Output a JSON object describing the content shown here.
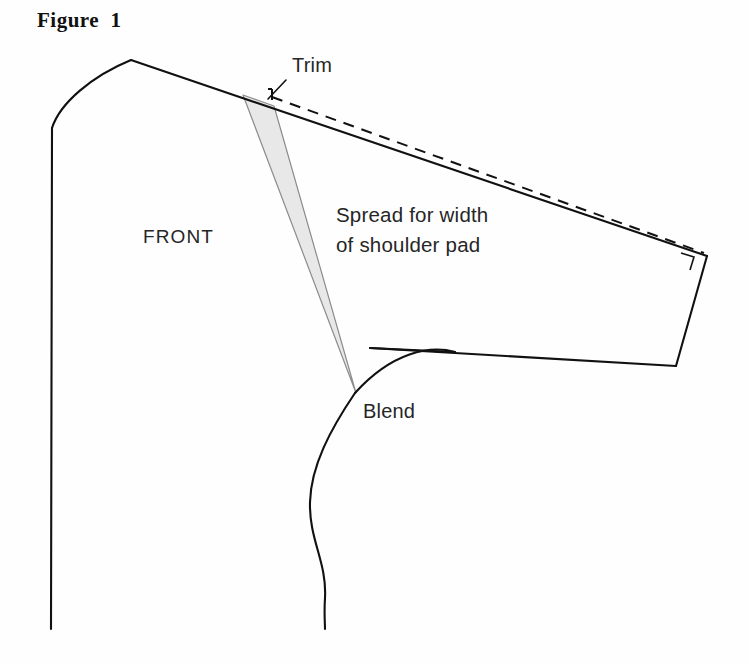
{
  "figure": {
    "title": "Figure  1",
    "background_color": "#fefefe",
    "ink_color": "#111111",
    "wedge_fill_color": "#e8e8e8",
    "wedge_stroke_color": "#8c8c8c"
  },
  "labels": {
    "trim": "Trim",
    "front": "FRONT",
    "spread_line1": "Spread for width",
    "spread_line2": "of shoulder pad",
    "blend": "Blend"
  },
  "label_positions": {
    "trim": {
      "x": 292,
      "y": 72
    },
    "front": {
      "x": 143,
      "y": 243
    },
    "spread_line1": {
      "x": 336,
      "y": 222
    },
    "spread_line2": {
      "x": 336,
      "y": 252
    },
    "blend": {
      "x": 363,
      "y": 418
    }
  },
  "geometry": {
    "center_front_line": "M 52,128 L 51,629",
    "neckline_curve": "M 52,128 C 60,103 92,76 131,60",
    "shoulder_line": "M 131,60 L 707,256",
    "armhole_right_edge": "M 707,256 L 676,366",
    "armhole_bottom_edge": "M 676,366 L 370,348",
    "underarm_straight": "M 370,348 L 455,352",
    "armhole_curve": "M 355,393 C 392,352 430,345 455,352",
    "side_seam_curve": "M 355,393 C 330,430 311,466 310,502 C 309,540 327,562 325,598 C 324,614 325,622 325,629",
    "trim_dashed": "M 268,89 L 272,89 M 272,89 L 272,104 M 272,97 L 704,253",
    "trim_leader": "M 286,80 L 268,99",
    "wedge": "M 243,95 L 274,106 L 356,393 Z",
    "right_angle_mark": "M 681,253 L 694,257 L 690,270"
  },
  "stroke_widths": {
    "pattern_outline": 2.1,
    "dashed_line": 2.0,
    "leader_line": 1.6,
    "wedge_outline": 1.2,
    "right_angle": 1.6
  },
  "dash_pattern": "11 8"
}
